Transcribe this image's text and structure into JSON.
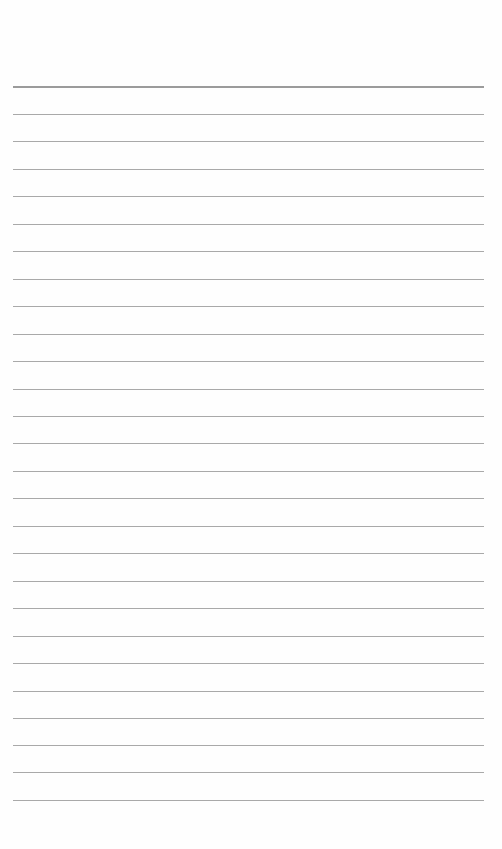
{
  "page": {
    "type": "lined-paper",
    "background": "#fefefe",
    "rule_color": "#9a9a9a",
    "header_rule_color": "#8a8a8a",
    "rule_left": 13,
    "rule_width": 471,
    "rules_y": [
      86,
      114,
      141,
      169,
      196,
      224,
      251,
      279,
      306,
      334,
      361,
      389,
      416,
      443,
      471,
      498,
      526,
      553,
      581,
      608,
      636,
      663,
      691,
      718,
      745,
      772,
      800
    ],
    "text": ""
  }
}
